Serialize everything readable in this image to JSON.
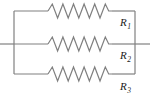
{
  "figure": {
    "kind": "circuit-diagram",
    "width": 150,
    "height": 97,
    "background_color": "#ffffff",
    "wire_color": "#808080",
    "label_color": "#1a1a1a",
    "wire_width": 1.2
  },
  "branches": [
    {
      "id": "branch-1",
      "label_main": "R",
      "label_sub": "1",
      "label_full": "R1",
      "y": 11,
      "resistor_x_start": 48,
      "resistor_x_end": 112,
      "zigzag_peaks": 6,
      "zigzag_amplitude": 7,
      "label_x": 120,
      "label_y": 26
    },
    {
      "id": "branch-2",
      "label_main": "R",
      "label_sub": "2",
      "label_full": "R2",
      "y": 44,
      "resistor_x_start": 48,
      "resistor_x_end": 112,
      "zigzag_peaks": 6,
      "zigzag_amplitude": 7,
      "label_x": 120,
      "label_y": 59
    },
    {
      "id": "branch-3",
      "label_main": "R",
      "label_sub": "3",
      "label_full": "R3",
      "y": 74,
      "resistor_x_start": 48,
      "resistor_x_end": 112,
      "zigzag_peaks": 6,
      "zigzag_amplitude": 7,
      "label_x": 120,
      "label_y": 90
    }
  ],
  "bus": {
    "left_x": 14,
    "right_x": 135,
    "top_y": 11,
    "bottom_y": 74
  },
  "terminals": {
    "left": {
      "x_start": 0,
      "x_end": 14,
      "y": 44
    },
    "right": {
      "x_start": 135,
      "x_end": 150,
      "y": 44
    }
  }
}
